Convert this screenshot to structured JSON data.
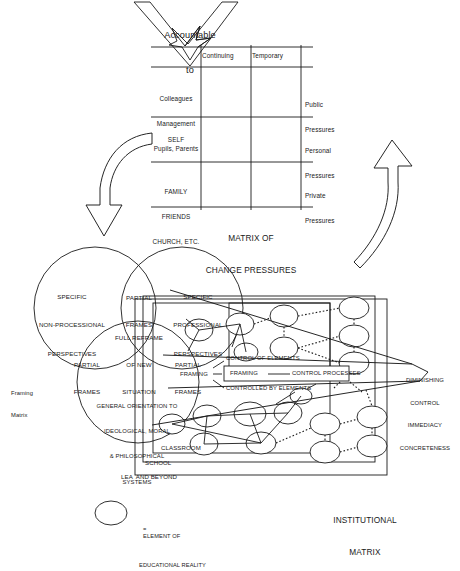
{
  "figure": {
    "accountable_arrow": {
      "line1": "Accountable",
      "line2": "to"
    },
    "matrix_change_pressures": {
      "title_line1": "MATRIX OF",
      "title_line2": "CHANGE PRESSURES",
      "column_headers": [
        "Continuing",
        "Temporary"
      ],
      "row_labels": [
        [
          "Colleagues",
          "Management",
          "Pupils, Parents"
        ],
        [
          "SELF"
        ],
        [
          "FAMILY",
          "FRIENDS",
          "CHURCH, ETC."
        ]
      ],
      "row_side_labels": [
        [
          "Public",
          "Pressures"
        ],
        [
          "Personal",
          "Pressures"
        ],
        [
          "Private",
          "Pressures"
        ]
      ],
      "cells": [
        [
          "",
          ""
        ],
        [
          "",
          ""
        ],
        [
          "",
          ""
        ]
      ]
    },
    "framing_matrix": {
      "caption_line1": "Framing",
      "caption_line2": "Matrix",
      "circle_left": [
        "SPECIFIC",
        "NON-PROCESSIONAL",
        "PERSPECTIVES"
      ],
      "circle_right": [
        "SPECIFIC",
        "PROFESSIONAL",
        "PERSPECTIVES"
      ],
      "circle_bottom": [
        "GENERAL ORIENTATION TO",
        "IDEOLOGICAL, MORAL",
        "& PHILOSOPHICAL",
        "SYSTEMS"
      ],
      "overlap_top": [
        "PARTIAL",
        "FRAMES"
      ],
      "overlap_left": [
        "PARTIAL",
        "FRAMES"
      ],
      "overlap_right": [
        "PARTIAL",
        "FRAMES"
      ],
      "center": [
        "FULL REFRAME",
        "OF NEW",
        "SITUATION"
      ]
    },
    "framing_control": {
      "node_label": "FRAMING",
      "branch_top": "CONTROL OF ELEMENTS",
      "branch_middle_left": "FRAMING",
      "branch_middle_right": "CONTROL PROCESSES",
      "branch_middle_dash": "——",
      "branch_bottom": "CONTROLLED BY ELEMENTS"
    },
    "institutional_matrix": {
      "title_line1": "INSTITUTIONAL",
      "title_line2": "MATRIX",
      "levels": [
        "CLASSROOM",
        "SCHOOL",
        "LEA  AND BEYOND"
      ],
      "gradient_labels": [
        "DIMINISHING",
        "CONTROL",
        "IMMEDIACY",
        "CONCRETENESS"
      ]
    },
    "legend": {
      "equals": "=",
      "line1": "ELEMENT OF",
      "line2": "EDUCATIONAL REALITY"
    },
    "colors": {
      "stroke": "#1a1a1a",
      "background": "#ffffff",
      "text": "#1a1a1a"
    }
  }
}
